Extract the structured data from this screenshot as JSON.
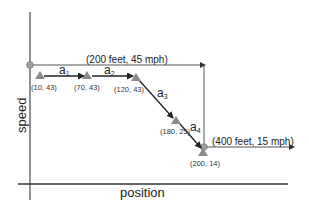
{
  "diagram": {
    "axes": {
      "x_label": "position",
      "y_label": "speed"
    },
    "points": [
      {
        "label": "(10, 43)",
        "x": 10,
        "y": 43
      },
      {
        "label": "(70, 43)",
        "x": 70,
        "y": 43
      },
      {
        "label": "(120, 43)",
        "x": 120,
        "y": 43
      },
      {
        "label": "(180, 25)",
        "x": 180,
        "y": 25
      },
      {
        "label": "(200, 14)",
        "x": 200,
        "y": 14
      }
    ],
    "segments": [
      {
        "name": "a",
        "sub": "1"
      },
      {
        "name": "a",
        "sub": "2"
      },
      {
        "name": "a",
        "sub": "3"
      },
      {
        "name": "a",
        "sub": "4"
      }
    ],
    "limits": [
      {
        "label": "(200 feet, 45 mph)",
        "position_feet": 200,
        "speed_mph": 45
      },
      {
        "label": "(400 feet, 15 mph)",
        "position_feet": 400,
        "speed_mph": 15
      }
    ],
    "colors": {
      "line": "#222222",
      "marker": "#8a8a8a",
      "limit_line": "#444444"
    }
  }
}
